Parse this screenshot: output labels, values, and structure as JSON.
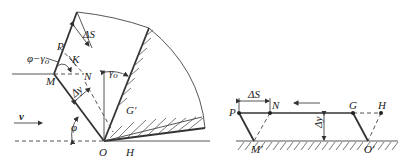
{
  "figure": {
    "left_diagram": {
      "name": "chip formation model (cutting zone)",
      "labels": {
        "P": "P",
        "K": "K",
        "N": "N",
        "M": "M",
        "O": "O",
        "H": "H",
        "G_prime": "G′",
        "delta_S": "ΔS",
        "delta_y": "Δy",
        "phi_minus_gamma": "φ−γ",
        "phi_minus_gamma_sub": "o",
        "gamma": "γ",
        "gamma_sub": "o",
        "phi": "φ",
        "velocity": "v"
      }
    },
    "right_diagram": {
      "name": "shear element deformation (parallelogram)",
      "labels": {
        "P": "P",
        "N": "N",
        "G": "G",
        "H": "H",
        "M_prime": "M′",
        "O_prime": "O′",
        "delta_S": "ΔS",
        "delta_y": "Δy"
      }
    },
    "colors": {
      "line": "#333333",
      "background": "#ffffff"
    }
  }
}
